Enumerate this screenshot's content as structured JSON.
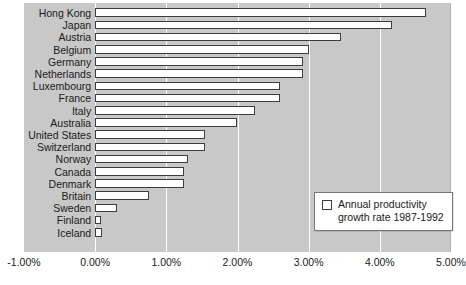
{
  "chart_data": {
    "type": "bar",
    "orientation": "horizontal",
    "title": "",
    "xlabel": "",
    "ylabel": "",
    "xlim": [
      -1.0,
      5.0
    ],
    "grid": true,
    "xtick_labels": [
      "-1.00%",
      "0.00%",
      "1.00%",
      "2.00%",
      "3.00%",
      "4.00%",
      "5.00%"
    ],
    "xtick_values": [
      -1.0,
      0.0,
      1.0,
      2.0,
      3.0,
      4.0,
      5.0
    ],
    "categories": [
      "Hong Kong",
      "Japan",
      "Austria",
      "Belgium",
      "Germany",
      "Netherlands",
      "Luxembourg",
      "France",
      "Italy",
      "Australia",
      "United States",
      "Switzerland",
      "Norway",
      "Canada",
      "Denmark",
      "Britain",
      "Sweden",
      "Finland",
      "Iceland"
    ],
    "values": [
      4.65,
      4.17,
      3.45,
      3.0,
      2.92,
      2.92,
      2.6,
      2.6,
      2.25,
      2.0,
      1.55,
      1.55,
      1.3,
      1.25,
      1.25,
      0.75,
      0.3,
      0.08,
      0.1
    ],
    "units": "percent",
    "series": [
      {
        "name": "Annual productivity growth rate 1987-1992",
        "values": [
          4.65,
          4.17,
          3.45,
          3.0,
          2.92,
          2.92,
          2.6,
          2.6,
          2.25,
          2.0,
          1.55,
          1.55,
          1.3,
          1.25,
          1.25,
          0.75,
          0.3,
          0.08,
          0.1
        ]
      }
    ],
    "legend": {
      "position": "inside-bottom-right",
      "entries": [
        {
          "label": "Annual productivity\ngrowth rate 1987-1992",
          "marker": "open-square",
          "color": "#ffffff"
        }
      ]
    },
    "colors": {
      "plot_background": "#c8c8c8",
      "bar_fill": "#ffffff",
      "bar_edge": "#3c3c3c",
      "gridline": "#ffffff",
      "text": "#1a1a1a",
      "page_background": "#ffffff"
    }
  }
}
